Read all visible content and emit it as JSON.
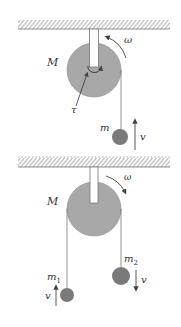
{
  "diagram": {
    "type": "pulley-systems",
    "colors": {
      "pulley_fill": "#a8a8a8",
      "mass_fill": "#7a7a7a",
      "line": "#555555",
      "hatch": "#888888"
    },
    "top_system": {
      "pulley_label": "M",
      "angular_velocity_label": "ω",
      "torque_label": "τ",
      "mass_label": "m",
      "velocity_label": "v",
      "velocity_direction": "up"
    },
    "bottom_system": {
      "pulley_label": "M",
      "angular_velocity_label": "ω",
      "mass1_label": "m",
      "mass1_sub": "1",
      "mass1_velocity_label": "v",
      "mass1_velocity_direction": "up",
      "mass2_label": "m",
      "mass2_sub": "2",
      "mass2_velocity_label": "v",
      "mass2_velocity_direction": "down"
    }
  }
}
